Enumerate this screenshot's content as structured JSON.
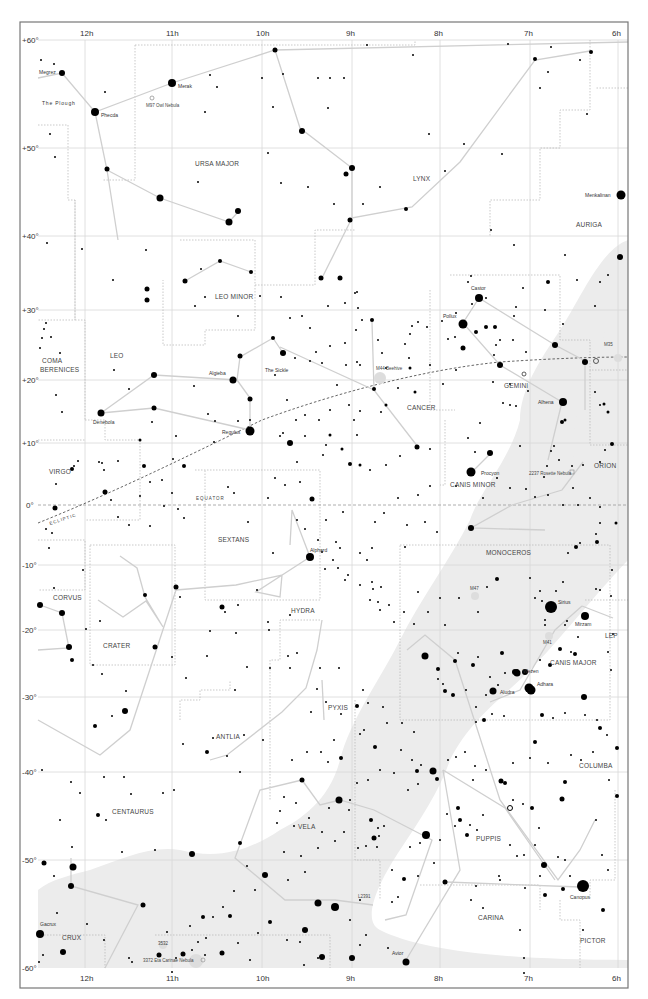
{
  "map": {
    "type": "star chart",
    "ra_labels": [
      "12h",
      "11h",
      "10h",
      "9h",
      "8h",
      "7h",
      "6h"
    ],
    "dec_labels": [
      "+60°",
      "+50°",
      "+40°",
      "+30°",
      "+20°",
      "+10°",
      "0°",
      "-10°",
      "-20°",
      "-30°",
      "-40°",
      "-50°",
      "-60°"
    ],
    "lines": {
      "equator": "EQUATOR",
      "ecliptic": "ECLIPTIC"
    },
    "constellations": [
      "URSA MAJOR",
      "LYNX",
      "AURIGA",
      "LEO MINOR",
      "COMA BERENICES",
      "LEO",
      "GEMINI",
      "CANCER",
      "VIRGO",
      "CANIS MINOR",
      "ORION",
      "SEXTANS",
      "MONOCEROS",
      "CORVUS",
      "CRATER",
      "HYDRA",
      "LEP",
      "CANIS MAJOR",
      "ANTLIA",
      "PYXIS",
      "COLUMBA",
      "CENTAURUS",
      "VELA",
      "PUPPIS",
      "CARINA",
      "CRUX",
      "PICTOR"
    ],
    "asterisms": [
      "The Plough",
      "The Sickle"
    ],
    "named_stars": [
      "Megrez",
      "Merak",
      "Phecda",
      "Menkalinan",
      "Castor",
      "Pollux",
      "Algieba",
      "Denebola",
      "Regulus",
      "Alhena",
      "Procyon",
      "Alphard",
      "Sirius",
      "Mirzam",
      "Wezen",
      "Adhara",
      "Aludra",
      "Canopus",
      "Avior",
      "Gacrux"
    ],
    "deep_sky": [
      "M97 Owl Nebula",
      "M44 Beehive",
      "M35",
      "2237 Rosette Nebula",
      "M47",
      "M41",
      "3532",
      "3372 Eta Carinae Nebula",
      "L2391"
    ],
    "colors": {
      "milky_way": "#ececec",
      "grid": "#d8d8d8",
      "figure_lines": "#cfcfcf",
      "stars": "#000000"
    }
  }
}
